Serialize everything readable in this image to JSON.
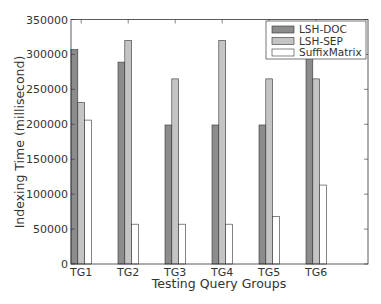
{
  "chart_data": {
    "type": "bar",
    "title": "",
    "xlabel": "Testing Query Groups",
    "ylabel": "Indexing Time (millisecond)",
    "categories": [
      "TG1",
      "TG2",
      "TG3",
      "TG4",
      "TG5",
      "TG6"
    ],
    "series": [
      {
        "name": "LSH-DOC",
        "color": "#8c8c8c",
        "values": [
          307000,
          289000,
          199000,
          199000,
          199000,
          300000
        ]
      },
      {
        "name": "LSH-SEP",
        "color": "#c4c4c4",
        "values": [
          231000,
          320000,
          265000,
          320000,
          265000,
          265000
        ]
      },
      {
        "name": "SuffixMatrix",
        "color": "#ffffff",
        "values": [
          206000,
          57000,
          57000,
          57000,
          68000,
          113000
        ]
      }
    ],
    "ylim": [
      0,
      350000
    ],
    "yticks": [
      0,
      50000,
      100000,
      150000,
      200000,
      250000,
      300000,
      350000
    ],
    "ytick_labels": [
      "0",
      "50000",
      "100000",
      "150000",
      "200000",
      "250000",
      "300000",
      "350000"
    ],
    "grid": false,
    "legend_position": "upper right"
  }
}
